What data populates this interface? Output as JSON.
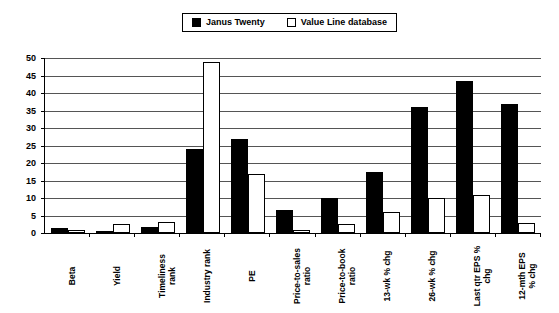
{
  "legend": {
    "position": "top-center",
    "entries": [
      {
        "label": "Janus Twenty",
        "swatch": "filled-square-icon",
        "color": "#000000"
      },
      {
        "label": "Value Line database",
        "swatch": "hollow-square-icon",
        "color": "#ffffff"
      }
    ]
  },
  "chart_data": {
    "type": "bar",
    "title": "",
    "subtitle": "",
    "xlabel": "",
    "ylabel": "",
    "ylim": [
      0,
      50
    ],
    "yticks": [
      0,
      5,
      10,
      15,
      20,
      25,
      30,
      35,
      40,
      45,
      50
    ],
    "grid": true,
    "legend_position": "top-center",
    "categories": [
      "Beta",
      "Yield",
      "Timeliness\nrank",
      "Industry rank",
      "PE",
      "Price-to-sales\nratio",
      "Price-to-book\nratio",
      "13-wk % chg",
      "26-wk % chg",
      "Last qtr EPS %\nchg",
      "12-mth EPS\n% chg"
    ],
    "series": [
      {
        "name": "Janus Twenty",
        "color": "#000000",
        "values": [
          1.3,
          0.5,
          1.8,
          24.0,
          27.0,
          6.5,
          10.0,
          17.5,
          36.0,
          43.5,
          37.0
        ]
      },
      {
        "name": "Value Line database",
        "color": "#ffffff",
        "values": [
          1.0,
          2.5,
          3.2,
          49.0,
          17.0,
          1.0,
          2.5,
          6.0,
          10.0,
          11.0,
          3.0
        ]
      }
    ]
  }
}
